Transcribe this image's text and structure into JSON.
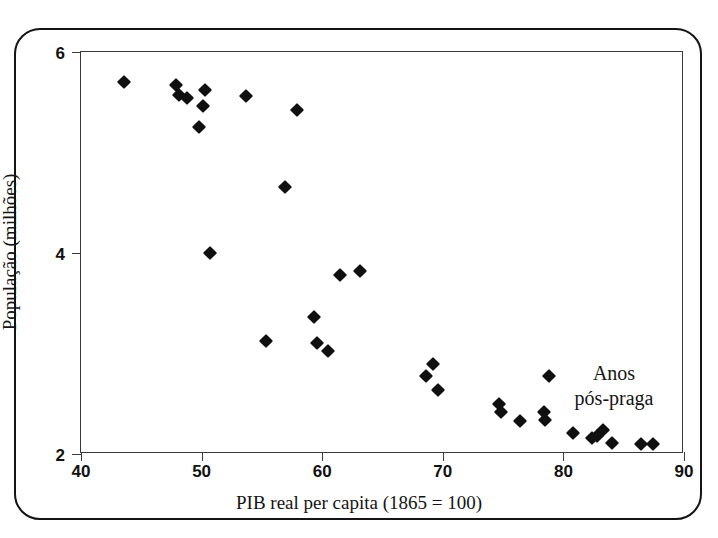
{
  "chart_data": {
    "type": "scatter",
    "title": "",
    "xlabel": "PIB real per capita (1865 = 100)",
    "ylabel": "População (milhões)",
    "xlim": [
      40,
      90
    ],
    "ylim": [
      2,
      6
    ],
    "xticks": [
      40,
      50,
      60,
      70,
      80,
      90
    ],
    "yticks": [
      2,
      4,
      6
    ],
    "grid": false,
    "legend": false,
    "marker": "filled-diamond",
    "marker_color": "#101010",
    "annotations": [
      {
        "text_line1": "Anos",
        "text_line2": "pós-praga",
        "x": 84.2,
        "y": 2.68
      }
    ],
    "series": [
      {
        "name": "População vs PIB real per capita",
        "points": [
          {
            "x": 43.6,
            "y": 5.7
          },
          {
            "x": 47.9,
            "y": 5.67
          },
          {
            "x": 48.1,
            "y": 5.57
          },
          {
            "x": 48.8,
            "y": 5.54
          },
          {
            "x": 50.3,
            "y": 5.62
          },
          {
            "x": 50.1,
            "y": 5.46
          },
          {
            "x": 49.8,
            "y": 5.25
          },
          {
            "x": 53.7,
            "y": 5.56
          },
          {
            "x": 57.9,
            "y": 5.42
          },
          {
            "x": 56.9,
            "y": 4.66
          },
          {
            "x": 50.7,
            "y": 4.0
          },
          {
            "x": 61.5,
            "y": 3.78
          },
          {
            "x": 63.1,
            "y": 3.82
          },
          {
            "x": 59.3,
            "y": 3.36
          },
          {
            "x": 55.3,
            "y": 3.12
          },
          {
            "x": 59.6,
            "y": 3.1
          },
          {
            "x": 60.5,
            "y": 3.02
          },
          {
            "x": 69.2,
            "y": 2.9
          },
          {
            "x": 68.6,
            "y": 2.78
          },
          {
            "x": 69.6,
            "y": 2.64
          },
          {
            "x": 74.7,
            "y": 2.5
          },
          {
            "x": 74.8,
            "y": 2.42
          },
          {
            "x": 76.4,
            "y": 2.33
          },
          {
            "x": 78.4,
            "y": 2.42
          },
          {
            "x": 78.5,
            "y": 2.34
          },
          {
            "x": 78.8,
            "y": 2.78
          },
          {
            "x": 80.8,
            "y": 2.21
          },
          {
            "x": 82.4,
            "y": 2.16
          },
          {
            "x": 82.8,
            "y": 2.18
          },
          {
            "x": 83.3,
            "y": 2.24
          },
          {
            "x": 84.0,
            "y": 2.11
          },
          {
            "x": 86.4,
            "y": 2.1
          },
          {
            "x": 87.4,
            "y": 2.1
          }
        ]
      }
    ]
  }
}
